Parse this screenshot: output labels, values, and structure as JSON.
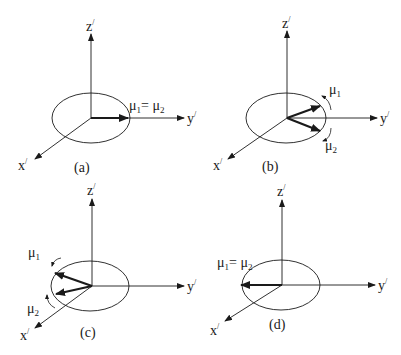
{
  "figure": {
    "panels": [
      {
        "id": "a",
        "caption": "(a)",
        "axes": {
          "z": "z",
          "y": "y",
          "x": "x",
          "prime": "/"
        },
        "moment_label": "μ",
        "sub1": "1",
        "eq": "= ",
        "sub2": "2",
        "state": "aligned along +y"
      },
      {
        "id": "b",
        "caption": "(b)",
        "axes": {
          "z": "z",
          "y": "y",
          "x": "x",
          "prime": "/"
        },
        "moment1": {
          "label": "μ",
          "sub": "1"
        },
        "moment2": {
          "label": "μ",
          "sub": "2"
        },
        "state": "splitting about +y"
      },
      {
        "id": "c",
        "caption": "(c)",
        "axes": {
          "z": "z",
          "y": "y",
          "x": "x",
          "prime": "/"
        },
        "moment1": {
          "label": "μ",
          "sub": "1"
        },
        "moment2": {
          "label": "μ",
          "sub": "2"
        },
        "state": "converging toward -y"
      },
      {
        "id": "d",
        "caption": "(d)",
        "axes": {
          "z": "z",
          "y": "y",
          "x": "x",
          "prime": "/"
        },
        "moment_label": "μ",
        "sub1": "1",
        "eq": "= ",
        "sub2": "2",
        "state": "aligned along -y"
      }
    ],
    "colors": {
      "line": "#1a1a1a",
      "background": "#ffffff"
    }
  }
}
